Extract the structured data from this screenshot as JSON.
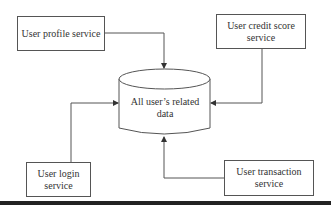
{
  "diagram": {
    "type": "data-flow",
    "central_store": {
      "shape": "database-cylinder",
      "label": "All user’s related data"
    },
    "services": [
      {
        "id": "profile",
        "label": "User profile service",
        "position": "top-left"
      },
      {
        "id": "credit",
        "label": "User credit score service",
        "position": "top-right"
      },
      {
        "id": "login",
        "label": "User login service",
        "position": "bottom-left"
      },
      {
        "id": "transaction",
        "label": "User transaction service",
        "position": "bottom-right"
      }
    ],
    "edges": [
      {
        "from": "profile",
        "to": "central_store",
        "arrow": "into top"
      },
      {
        "from": "credit",
        "to": "central_store",
        "arrow": "into right side"
      },
      {
        "from": "login",
        "to": "central_store",
        "arrow": "into left side"
      },
      {
        "from": "transaction",
        "to": "central_store",
        "arrow": "into bottom"
      }
    ],
    "colors": {
      "line": "#555555",
      "background": "#ffffff",
      "bar": "#222222"
    }
  }
}
